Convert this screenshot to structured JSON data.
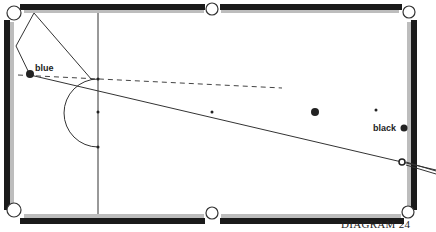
{
  "diagram": {
    "caption": "DIAGRAM 24",
    "balls": {
      "blue": {
        "label": "blue",
        "x": 30,
        "y": 75
      },
      "black": {
        "label": "black",
        "x": 404,
        "y": 128
      },
      "cue": {
        "x": 402,
        "y": 162
      },
      "pink": {
        "x": 315,
        "y": 112
      },
      "spot_brown": {
        "x": 98,
        "y": 112
      },
      "spot_center": {
        "x": 212,
        "y": 112
      },
      "spot_black": {
        "x": 376,
        "y": 110
      }
    },
    "colors": {
      "cushion_dark": "#1a1a1a",
      "cushion_light": "#bdbdbd",
      "line": "#333333",
      "background": "#ffffff"
    }
  }
}
